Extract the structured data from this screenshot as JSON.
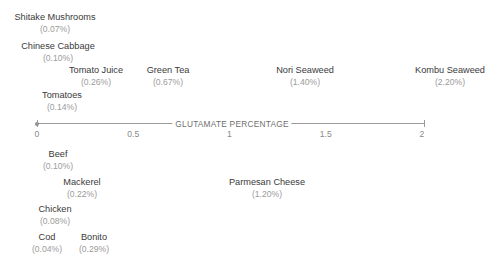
{
  "chart_data": {
    "type": "scatter",
    "title": "",
    "xlabel": "GLUTAMATE PERCENTAGE",
    "ylabel": "",
    "xlim": [
      0,
      2.2
    ],
    "axis_range_drawn": [
      0,
      2.2
    ],
    "grid": false,
    "legend": false,
    "tick_labels": [
      "0",
      "0.5",
      "1",
      "1.5",
      "2"
    ],
    "tick_values": [
      0,
      0.5,
      1,
      1.5,
      2
    ],
    "annotations": "Each food is labelled with its name and glutamate percentage, positioned horizontally at its value along the axis; plant-derived foods above the axis, animal-derived foods and cheese below.",
    "categories": [
      "Shitake Mushrooms",
      "Chinese Cabbage",
      "Tomato Juice",
      "Green Tea",
      "Nori Seaweed",
      "Kombu Seaweed",
      "Tomatoes",
      "Beef",
      "Mackerel",
      "Parmesan Cheese",
      "Chicken",
      "Cod",
      "Bonito"
    ],
    "values": [
      0.07,
      0.1,
      0.26,
      0.67,
      1.4,
      2.2,
      0.14,
      0.1,
      0.22,
      1.2,
      0.08,
      0.04,
      0.29
    ],
    "points_above": [
      {
        "name": "Shitake Mushrooms",
        "value": 0.07,
        "value_label": "(0.07%)",
        "x_px": 55,
        "y_px": 13
      },
      {
        "name": "Chinese Cabbage",
        "value": 0.1,
        "value_label": "(0.10%)",
        "x_px": 58,
        "y_px": 42
      },
      {
        "name": "Tomato Juice",
        "value": 0.26,
        "value_label": "(0.26%)",
        "x_px": 96,
        "y_px": 66
      },
      {
        "name": "Green Tea",
        "value": 0.67,
        "value_label": "(0.67%)",
        "x_px": 168,
        "y_px": 66
      },
      {
        "name": "Nori Seaweed",
        "value": 1.4,
        "value_label": "(1.40%)",
        "x_px": 305,
        "y_px": 66
      },
      {
        "name": "Kombu Seaweed",
        "value": 2.2,
        "value_label": "(2.20%)",
        "x_px": 450,
        "y_px": 66
      },
      {
        "name": "Tomatoes",
        "value": 0.14,
        "value_label": "(0.14%)",
        "x_px": 62,
        "y_px": 91
      }
    ],
    "points_below": [
      {
        "name": "Beef",
        "value": 0.1,
        "value_label": "(0.10%)",
        "x_px": 58,
        "y_px": 150
      },
      {
        "name": "Mackerel",
        "value": 0.22,
        "value_label": "(0.22%)",
        "x_px": 82,
        "y_px": 178
      },
      {
        "name": "Parmesan Cheese",
        "value": 1.2,
        "value_label": "(1.20%)",
        "x_px": 267,
        "y_px": 178
      },
      {
        "name": "Chicken",
        "value": 0.08,
        "value_label": "(0.08%)",
        "x_px": 55,
        "y_px": 205
      },
      {
        "name": "Cod",
        "value": 0.04,
        "value_label": "(0.04%)",
        "x_px": 47,
        "y_px": 233
      },
      {
        "name": "Bonito",
        "value": 0.29,
        "value_label": "(0.29%)",
        "x_px": 94,
        "y_px": 233
      }
    ],
    "colors": {
      "background": "#ffffff",
      "axis": "#9a9a9a",
      "name_text": "#3a3a3a",
      "value_text": "#9b9b9b",
      "tick_text": "#8a8a8a",
      "axis_title_text": "#6f6f6f"
    },
    "geometry": {
      "axis_y_px": 123,
      "axis_x0_px": 37,
      "axis_x1_px": 424,
      "px_per_unit": 192.5,
      "title_center_x_px": 232
    }
  }
}
